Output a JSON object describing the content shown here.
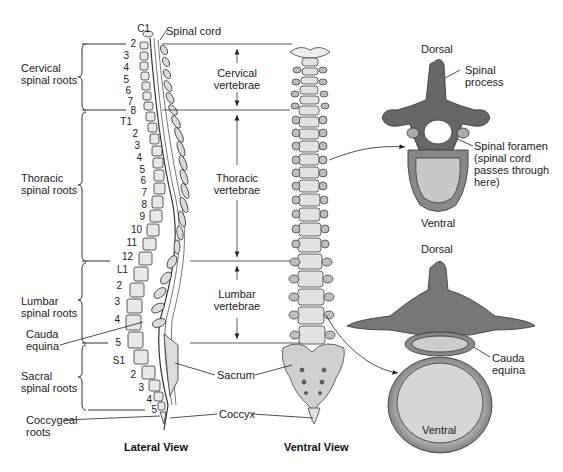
{
  "lateral_view": {
    "title": "Lateral View",
    "top_label": "Spinal cord",
    "regions": [
      {
        "label_line1": "Cervical",
        "label_line2": "spinal roots"
      },
      {
        "label_line1": "Thoracic",
        "label_line2": "spinal roots"
      },
      {
        "label_line1": "Lumbar",
        "label_line2": "spinal roots"
      },
      {
        "label_line1": "Sacral",
        "label_line2": "spinal roots"
      }
    ],
    "cauda_equina": {
      "line1": "Cauda",
      "line2": "equina"
    },
    "coccygeal": {
      "line1": "Coccygeal",
      "line2": "roots"
    },
    "vertebra_numbers": {
      "cervical": [
        "C1",
        "2",
        "3",
        "4",
        "5",
        "6",
        "7",
        "8"
      ],
      "thoracic": [
        "T1",
        "2",
        "3",
        "4",
        "5",
        "6",
        "7",
        "8",
        "9",
        "10",
        "11",
        "12"
      ],
      "lumbar": [
        "L1",
        "2",
        "3",
        "4",
        "5"
      ],
      "sacral": [
        "S1",
        "2",
        "3",
        "4",
        "5"
      ]
    }
  },
  "ventral_view": {
    "title": "Ventral View",
    "regions": [
      {
        "line1": "Cervical",
        "line2": "vertebrae"
      },
      {
        "line1": "Thoracic",
        "line2": "vertebrae"
      },
      {
        "line1": "Lumbar",
        "line2": "vertebrae"
      }
    ],
    "sacrum": "Sacrum",
    "coccyx": "Coccyx"
  },
  "thoracic_cross_section": {
    "dorsal": "Dorsal",
    "ventral": "Ventral",
    "spinal_process": {
      "line1": "Spinal",
      "line2": "process"
    },
    "spinal_foramen": {
      "line1": "Spinal foramen",
      "line2": "(spinal cord",
      "line3": "passes through",
      "line4": "here)"
    }
  },
  "lumbar_cross_section": {
    "dorsal": "Dorsal",
    "ventral": "Ventral",
    "cauda_equina": {
      "line1": "Cauda",
      "line2": "equina"
    }
  }
}
